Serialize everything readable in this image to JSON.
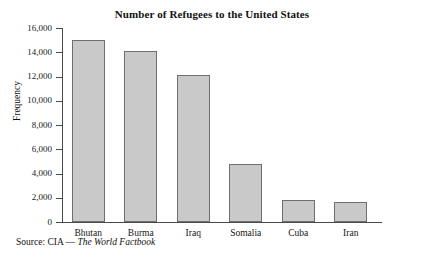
{
  "chart_data": {
    "type": "bar",
    "title": "Number of Refugees to the United States",
    "xlabel": "",
    "ylabel": "Frequency",
    "categories": [
      "Bhutan",
      "Burma",
      "Iraq",
      "Somalia",
      "Cuba",
      "Iran"
    ],
    "values": [
      15050,
      14100,
      12100,
      4800,
      1850,
      1650
    ],
    "ylim": [
      0,
      16000
    ],
    "yticks": [
      0,
      2000,
      4000,
      6000,
      8000,
      10000,
      12000,
      14000,
      16000
    ],
    "ytick_labels": [
      "0",
      "2,000",
      "4,000",
      "6,000",
      "8,000",
      "10,000",
      "12,000",
      "14,000",
      "16,000"
    ],
    "grid": false,
    "legend": false,
    "bar_fill_color": "#c9c9c9",
    "bar_edge_color": "#6f6f6f",
    "axis_color": "#4a4a4a"
  },
  "source": {
    "prefix": "Source: CIA — ",
    "publication": "The World Factbook"
  }
}
